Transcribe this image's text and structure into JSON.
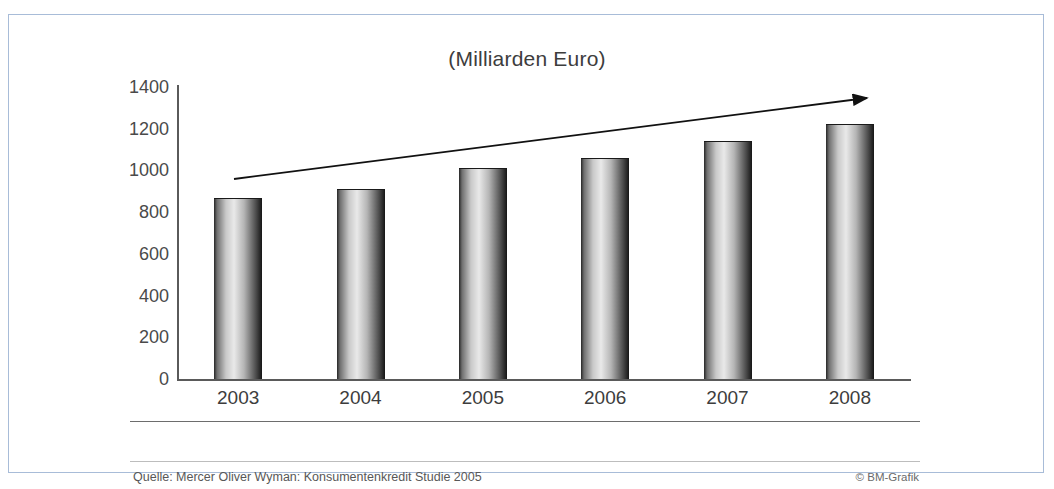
{
  "frame": {
    "border_color": "#a8bcd8",
    "background": "#ffffff",
    "top_stub_text": ""
  },
  "footer": {
    "source": "Quelle: Mercer Oliver Wyman: Konsumentenkredit Studie 2005",
    "credit": "© BM-Grafik"
  },
  "chart_data": {
    "type": "bar",
    "title": "(Milliarden Euro)",
    "xlabel": "",
    "ylabel": "",
    "categories": [
      "2003",
      "2004",
      "2005",
      "2006",
      "2007",
      "2008"
    ],
    "values": [
      870,
      910,
      1010,
      1060,
      1140,
      1225
    ],
    "ylim": [
      0,
      1400
    ],
    "yticks": [
      0,
      200,
      400,
      600,
      800,
      1000,
      1200,
      1400
    ],
    "ytick_labels": [
      "0",
      "200",
      "400",
      "600",
      "800",
      "1000",
      "1200",
      "1400"
    ],
    "grid": false,
    "legend": "none",
    "bar_style": "cylinder-gradient",
    "colors": {
      "bar_light": "#e9e9e9",
      "bar_dark": "#151515",
      "axis": "#5a5a5a",
      "text": "#3d3d3d"
    },
    "annotations": [
      {
        "type": "arrow",
        "name": "growth-trend-arrow",
        "from": [
          2003,
          930
        ],
        "to": [
          2008,
          1340
        ],
        "color": "#1a1a1a"
      }
    ]
  }
}
